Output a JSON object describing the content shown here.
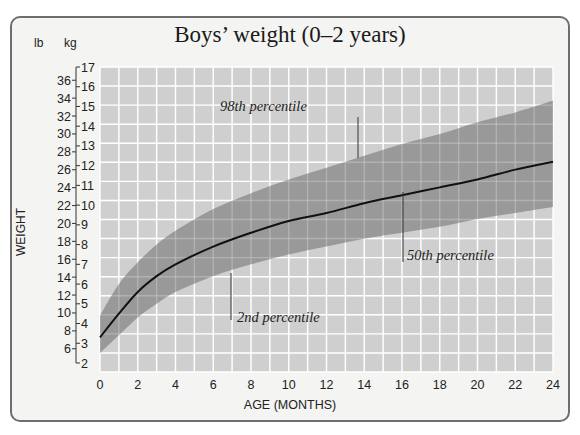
{
  "header": {
    "title": "Boys’ weight (0–2 years)",
    "unit_lb": "lb",
    "unit_kg": "kg"
  },
  "axes": {
    "ylabel": "WEIGHT",
    "xlabel": "AGE (MONTHS)"
  },
  "annotations": {
    "p98": "98th percentile",
    "p50": "50th percentile",
    "p2": "2nd percentile"
  },
  "colors": {
    "frame_bg": "#f4f4f2",
    "frame_border": "#6e6e6e",
    "grid_bg": "#cfcfcf",
    "grid_lines": "#ffffff",
    "band": "#8f8f8f",
    "median_line": "#111111"
  },
  "chart_data": {
    "type": "area",
    "title": "Boys’ weight (0–2 years)",
    "xlabel": "AGE (MONTHS)",
    "ylabel": "WEIGHT",
    "x_unit": "months",
    "y_units": [
      "lb",
      "kg"
    ],
    "xlim": [
      0,
      24
    ],
    "ylim_kg": [
      2,
      17
    ],
    "x_ticks": [
      0,
      2,
      4,
      6,
      8,
      10,
      12,
      14,
      16,
      18,
      20,
      22,
      24
    ],
    "y_ticks_kg": [
      2,
      3,
      4,
      5,
      6,
      7,
      8,
      9,
      10,
      11,
      12,
      13,
      14,
      15,
      16,
      17
    ],
    "y_ticks_lb": [
      6,
      8,
      10,
      12,
      14,
      16,
      18,
      20,
      22,
      24,
      26,
      28,
      30,
      32,
      34,
      36
    ],
    "grid": true,
    "x": [
      0,
      1,
      2,
      3,
      4,
      6,
      8,
      10,
      12,
      14,
      16,
      18,
      20,
      22,
      24
    ],
    "series": [
      {
        "name": "98th percentile",
        "unit": "kg",
        "values": [
          4.4,
          6.0,
          7.1,
          8.0,
          8.7,
          9.8,
          10.6,
          11.3,
          11.9,
          12.5,
          13.1,
          13.6,
          14.2,
          14.7,
          15.3
        ]
      },
      {
        "name": "50th percentile",
        "unit": "kg",
        "values": [
          3.3,
          4.5,
          5.6,
          6.4,
          7.0,
          7.9,
          8.6,
          9.2,
          9.6,
          10.1,
          10.5,
          10.9,
          11.3,
          11.8,
          12.2
        ]
      },
      {
        "name": "2nd percentile",
        "unit": "kg",
        "values": [
          2.5,
          3.4,
          4.3,
          5.0,
          5.6,
          6.4,
          7.0,
          7.5,
          7.9,
          8.3,
          8.6,
          8.9,
          9.3,
          9.6,
          9.9
        ]
      }
    ],
    "legend": "inline annotations"
  }
}
